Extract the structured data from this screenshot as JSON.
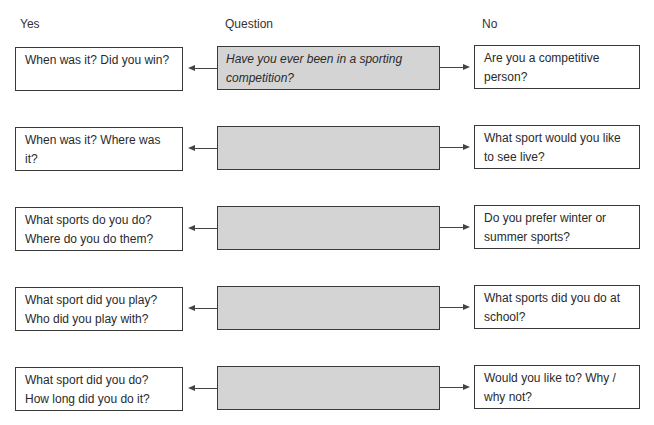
{
  "headers": {
    "yes": "Yes",
    "question": "Question",
    "no": "No"
  },
  "rows": [
    {
      "yes": "When was it? Did you win?",
      "question": "Have you ever been in a sporting competition?",
      "no": "Are you a competitive person?"
    },
    {
      "yes": "When was it? Where was it?",
      "question": "",
      "no": "What sport would you like to see live?"
    },
    {
      "yes": "What sports do you do? Where do you do them?",
      "question": "",
      "no": "Do you prefer winter or summer sports?"
    },
    {
      "yes": "What sport did you play? Who did you play with?",
      "question": "",
      "no": "What sports did you do at school?"
    },
    {
      "yes": "What sport did you do? How long did you do it?",
      "question": "",
      "no": "Would you like to? Why / why not?"
    }
  ],
  "colors": {
    "question_fill": "#d4d4d4",
    "border": "#3a3a3a",
    "text": "#2a2a2a"
  }
}
